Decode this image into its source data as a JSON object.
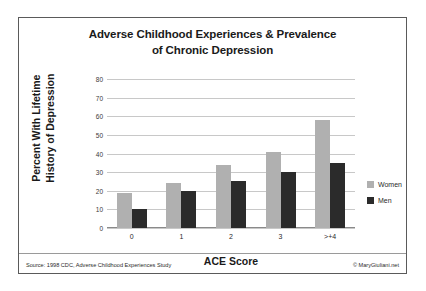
{
  "chart_data": {
    "type": "bar",
    "title": "Adverse Childhood Experiences & Prevalence of Chronic Depression",
    "title_line1": "Adverse Childhood Experiences & Prevalence",
    "title_line2": "of Chronic Depression",
    "xlabel": "ACE Score",
    "ylabel": "Percent With Lifetime History of Depression",
    "ylabel_line1": "Percent With Lifetime",
    "ylabel_line2": "History of Depression",
    "categories": [
      "0",
      "1",
      "2",
      "3",
      ">+4"
    ],
    "yticks": [
      "80",
      "70",
      "60",
      "50",
      "40",
      "30",
      "20",
      "10",
      "0"
    ],
    "ylim": [
      0,
      80
    ],
    "grid": true,
    "legend_position": "right",
    "series": [
      {
        "name": "Women",
        "color": "#b0b0b0",
        "values": [
          19,
          24,
          34,
          41,
          58
        ]
      },
      {
        "name": "Men",
        "color": "#2b2b2b",
        "values": [
          10,
          20,
          25,
          30,
          35
        ]
      }
    ]
  },
  "footer": {
    "source": "Source: 1998 CDC, Adverse Childhood Experiences Study",
    "copyright": "© MaryGiuliani.net"
  }
}
